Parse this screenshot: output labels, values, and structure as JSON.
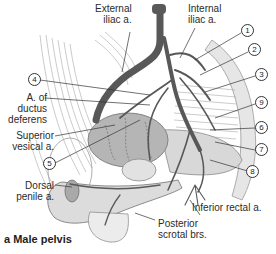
{
  "figure": {
    "caption": "a Male pelvis",
    "colors": {
      "artery": "#5a5a5a",
      "tissue": "#d9d9d9",
      "outline": "#8a8a8a",
      "bladder": "#b3b3b3"
    }
  },
  "labels": {
    "external_iliac": [
      "External",
      "iliac a."
    ],
    "internal_iliac": [
      "Internal",
      "iliac a."
    ],
    "ductus_deferens": [
      "A. of",
      "ductus",
      "deferens"
    ],
    "superior_vesical": [
      "Superior",
      "vesical a."
    ],
    "dorsal_penile": [
      "Dorsal",
      "penile a."
    ],
    "inferior_rectal": "Inferior rectal a.",
    "posterior_scrotal": [
      "Posterior",
      "scrotal brs."
    ]
  },
  "callouts": [
    "1",
    "2",
    "3",
    "4",
    "5",
    "6",
    "7",
    "8",
    "9"
  ]
}
